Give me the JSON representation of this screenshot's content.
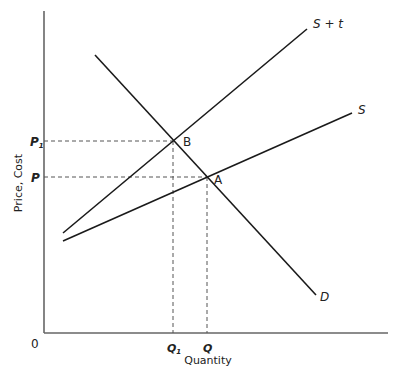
{
  "diagram": {
    "type": "supply-demand-tax",
    "axes": {
      "y_label": "Price, Cost",
      "x_label": "Quantity",
      "origin_label": "0"
    },
    "price_ticks": [
      {
        "label": "P",
        "sub": "1",
        "y": 141
      },
      {
        "label": "P",
        "sub": "",
        "y": 177
      }
    ],
    "quantity_ticks": [
      {
        "label": "Q",
        "sub": "1",
        "x": 173
      },
      {
        "label": "Q",
        "sub": "",
        "x": 207
      }
    ],
    "curves": [
      {
        "name": "S + t",
        "label": "S + t",
        "x1": 63,
        "y1": 233,
        "x2": 307,
        "y2": 29
      },
      {
        "name": "S",
        "label": "S",
        "x1": 63,
        "y1": 241,
        "x2": 352,
        "y2": 113
      },
      {
        "name": "D",
        "label": "D",
        "x1": 95,
        "y1": 55,
        "x2": 316,
        "y2": 295
      }
    ],
    "points": [
      {
        "label": "B",
        "x": 173,
        "y": 141
      },
      {
        "label": "A",
        "x": 207,
        "y": 177
      }
    ],
    "colors": {
      "line": "#1a1a1a",
      "axis": "#666666",
      "dashed": "#555555",
      "text": "#222222"
    }
  }
}
